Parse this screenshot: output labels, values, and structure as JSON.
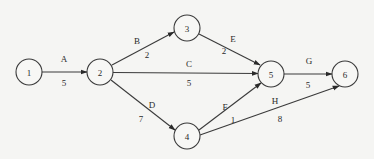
{
  "diagram": {
    "type": "activity-on-arrow network",
    "nodes": [
      {
        "id": "1",
        "label": "1",
        "x": 29,
        "y": 72
      },
      {
        "id": "2",
        "label": "2",
        "x": 100,
        "y": 72
      },
      {
        "id": "3",
        "label": "3",
        "x": 187,
        "y": 28
      },
      {
        "id": "4",
        "label": "4",
        "x": 187,
        "y": 136
      },
      {
        "id": "5",
        "label": "5",
        "x": 271,
        "y": 74
      },
      {
        "id": "6",
        "label": "6",
        "x": 345,
        "y": 74
      }
    ],
    "edges": [
      {
        "id": "A",
        "from": "1",
        "to": "2",
        "activity": "A",
        "duration": "5"
      },
      {
        "id": "B",
        "from": "2",
        "to": "3",
        "activity": "B",
        "duration": "2"
      },
      {
        "id": "C",
        "from": "2",
        "to": "5",
        "activity": "C",
        "duration": "5"
      },
      {
        "id": "D",
        "from": "2",
        "to": "4",
        "activity": "D",
        "duration": "7"
      },
      {
        "id": "E",
        "from": "3",
        "to": "5",
        "activity": "E",
        "duration": "2"
      },
      {
        "id": "F",
        "from": "4",
        "to": "5",
        "activity": "F",
        "duration": "1"
      },
      {
        "id": "G",
        "from": "5",
        "to": "6",
        "activity": "G",
        "duration": "5"
      },
      {
        "id": "H",
        "from": "4",
        "to": "6",
        "activity": "H",
        "duration": "8"
      }
    ]
  }
}
